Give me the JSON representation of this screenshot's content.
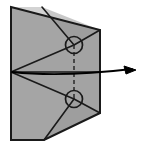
{
  "canvas": {
    "width": 144,
    "height": 146,
    "background": "#ffffff",
    "title": "origami-fold-step-diagram"
  },
  "style": {
    "paper_fill": "#a3a3a3",
    "paper_fill_light": "#b0b0b0",
    "paper_fill_dark": "#969696",
    "outline_color": "#1a1a1a",
    "fold_line_color": "#1a1a1a",
    "dashed_line_color": "#2a2a2a",
    "arrow_color": "#000000",
    "outline_width": 2,
    "fold_line_width": 1.6,
    "dash_pattern": "4 3"
  },
  "shapes": {
    "paper_outline_label": "paper-body",
    "paper_outline_points": "11,7 100,30 100,113 44,140 11,140",
    "left_panel_points": "11,7 42,7 74,45 11,72",
    "lower_left_panel_points": "11,72 74,99 44,140 11,140",
    "top_facet_points": "42,7 100,30 74,45",
    "bottom_facet_points": "74,99 100,113 44,140"
  },
  "fold_lines": [
    {
      "name": "fold-top-left-diagonal",
      "x1": 42,
      "y1": 7,
      "x2": 74,
      "y2": 45
    },
    {
      "name": "fold-top-right-diagonal",
      "x1": 100,
      "y1": 30,
      "x2": 74,
      "y2": 45
    },
    {
      "name": "fold-apex-to-upper-circle",
      "x1": 11,
      "y1": 72,
      "x2": 74,
      "y2": 45
    },
    {
      "name": "fold-apex-to-lower-circle",
      "x1": 11,
      "y1": 72,
      "x2": 74,
      "y2": 99
    },
    {
      "name": "fold-apex-horizontal",
      "x1": 11,
      "y1": 72,
      "x2": 100,
      "y2": 72
    },
    {
      "name": "fold-lower-left-diagonal",
      "x1": 74,
      "y1": 99,
      "x2": 44,
      "y2": 140
    },
    {
      "name": "fold-lower-right-diagonal",
      "x1": 74,
      "y1": 99,
      "x2": 100,
      "y2": 113
    }
  ],
  "dashed_line": {
    "name": "hidden-fold-axis",
    "x1": 74,
    "y1": 45,
    "x2": 74,
    "y2": 99
  },
  "circles": [
    {
      "name": "upper-rotation-marker",
      "cx": 74,
      "cy": 45,
      "r": 8.5
    },
    {
      "name": "lower-rotation-marker",
      "cx": 74,
      "cy": 99,
      "r": 8.5
    }
  ],
  "arrow": {
    "name": "fold-direction-arrow",
    "path": "M 12,72 C 50,76 90,74 132,69",
    "tip_x": 134,
    "tip_y": 70,
    "head_points": "136,70 124,66 126,74",
    "label": ""
  },
  "annotations": {
    "caption": "",
    "step_number": ""
  }
}
